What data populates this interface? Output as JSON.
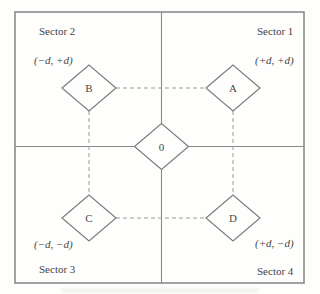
{
  "figure": {
    "sectors": {
      "s1": {
        "name": "Sector 1",
        "coords": "(+d, +d)"
      },
      "s2": {
        "name": "Sector 2",
        "coords": "(−d, +d)"
      },
      "s3": {
        "name": "Sector 3",
        "coords": "(−d, −d)"
      },
      "s4": {
        "name": "Sector 4",
        "coords": "(+d, −d)"
      }
    },
    "nodes": {
      "center": "0",
      "a": "A",
      "b": "B",
      "c": "C",
      "d": "D"
    },
    "colors": {
      "line": "#8a8a8a",
      "dashed": "#9a9a9a",
      "diamond_stroke": "#7d7d7d",
      "text": "#454545",
      "background": "#fefefd"
    }
  }
}
